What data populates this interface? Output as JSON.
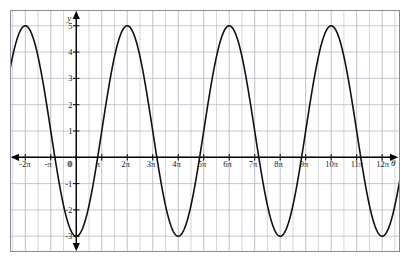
{
  "chart_data": {
    "type": "line",
    "title": "",
    "subtitle": "",
    "xlabel": "θ",
    "ylabel": "y",
    "xlim": [
      -2.6,
      12.7
    ],
    "ylim": [
      -3.6,
      5.6
    ],
    "xlim_units": "multiples of pi",
    "grid": true,
    "grid_step_x_pi": 0.5,
    "grid_step_y": 1,
    "legend": "none",
    "function": "y = 1 - 4 cos(x/2), x in radians (x axis in multiples of pi)",
    "amplitude": 4,
    "midline": 1,
    "period_pi": 4,
    "maximum": 5,
    "minimum": -3,
    "x_tick_labels": [
      "-2π",
      "-π",
      "0",
      "π",
      "2π",
      "3π",
      "4π",
      "5π",
      "6π",
      "7π",
      "8π",
      "9π",
      "10π",
      "11π",
      "12π"
    ],
    "x_tick_values_pi": [
      -2,
      -1,
      0,
      1,
      2,
      3,
      4,
      5,
      6,
      7,
      8,
      9,
      10,
      11,
      12
    ],
    "y_tick_labels": [
      "5",
      "4",
      "3",
      "2",
      "1",
      "0",
      "-1",
      "-2",
      "-3"
    ],
    "y_tick_values": [
      5,
      4,
      3,
      2,
      1,
      0,
      -1,
      -2,
      -3
    ],
    "peaks_x_pi": [
      -1,
      3,
      7,
      11
    ],
    "peaks_y": [
      5,
      5,
      5,
      5
    ],
    "troughs_x_pi": [
      1,
      5,
      9
    ],
    "troughs_y": [
      -3,
      -3,
      -3
    ],
    "series": [
      {
        "name": "y = 1 - 4 cos(x/2)",
        "color": "#111111",
        "x_pi": [
          -2.6,
          -2.5,
          -2.4,
          -2.3,
          -2.2,
          -2.1,
          -2.0,
          -1.9,
          -1.8,
          -1.7,
          -1.6,
          -1.5,
          -1.4,
          -1.3,
          -1.2,
          -1.1,
          -1.0,
          -0.9,
          -0.8,
          -0.7,
          -0.6,
          -0.5,
          -0.4,
          -0.3,
          -0.2,
          -0.1,
          0.0,
          0.1,
          0.2,
          0.3,
          0.4,
          0.5,
          0.6,
          0.7,
          0.8,
          0.9,
          1.0,
          1.1,
          1.2,
          1.3,
          1.4,
          1.5,
          1.6,
          1.7,
          1.8,
          1.9,
          2.0,
          2.1,
          2.2,
          2.3,
          2.4,
          2.5,
          2.6,
          2.7,
          2.8,
          2.9,
          3.0,
          3.1,
          3.2,
          3.3,
          3.4,
          3.5,
          3.6,
          3.7,
          3.8,
          3.9,
          4.0,
          4.1,
          4.2,
          4.3,
          4.4,
          4.5,
          4.6,
          4.7,
          4.8,
          4.9,
          5.0,
          5.1,
          5.2,
          5.3,
          5.4,
          5.5,
          5.6,
          5.7,
          5.8,
          5.9,
          6.0,
          6.1,
          6.2,
          6.3,
          6.4,
          6.5,
          6.6,
          6.7,
          6.8,
          6.9,
          7.0,
          7.1,
          7.2,
          7.3,
          7.4,
          7.5,
          7.6,
          7.7,
          7.8,
          7.9,
          8.0,
          8.1,
          8.2,
          8.3,
          8.4,
          8.5,
          8.6,
          8.7,
          8.8,
          8.9,
          9.0,
          9.1,
          9.2,
          9.3,
          9.4,
          9.5,
          9.6,
          9.7,
          9.8,
          9.9,
          10.0,
          10.1,
          10.2,
          10.3,
          10.4,
          10.5,
          10.6,
          10.7,
          10.8,
          10.9,
          11.0,
          11.1,
          11.2,
          11.3,
          11.4,
          11.5,
          11.6,
          11.7,
          11.8,
          11.9,
          12.0,
          12.1,
          12.2,
          12.3,
          12.4,
          12.5,
          12.6,
          12.7
        ],
        "y": [
          -2.24,
          -1.53,
          -0.74,
          0.1,
          0.98,
          1.88,
          2.76,
          3.62,
          4.41,
          5.0,
          5.0,
          5.0,
          5.0,
          5.0,
          5.0,
          5.0,
          5.0,
          5.0,
          5.0,
          5.0,
          4.41,
          3.62,
          2.76,
          1.88,
          0.98,
          0.1,
          -0.74,
          -1.53,
          -2.24,
          -2.83,
          -3.0,
          -3.0,
          -3.0,
          -3.0,
          -3.0,
          -3.0,
          -3.0,
          -3.0,
          -3.0,
          -3.0,
          -2.83,
          -2.24,
          -1.53,
          -0.74,
          0.1,
          0.98,
          1.88,
          2.76,
          3.62,
          4.41,
          5.0,
          5.0,
          5.0,
          5.0,
          5.0,
          5.0,
          5.0,
          5.0,
          5.0,
          5.0,
          4.41,
          3.62,
          2.76,
          1.88,
          0.98,
          0.1,
          -0.74,
          -1.53,
          -2.24,
          -2.83,
          -3.0,
          -3.0,
          -3.0,
          -3.0,
          -3.0,
          -3.0,
          -3.0,
          -3.0,
          -3.0,
          -3.0,
          -2.83,
          -2.24,
          -1.53,
          -0.74,
          0.1,
          0.98,
          1.88,
          2.76,
          3.62,
          4.41,
          5.0,
          5.0,
          5.0,
          5.0,
          5.0,
          5.0,
          5.0,
          5.0,
          5.0,
          5.0,
          4.41,
          3.62,
          2.76,
          1.88,
          0.98,
          0.1,
          -0.74,
          -1.53,
          -2.24,
          -2.83,
          -3.0,
          -3.0,
          -3.0,
          -3.0,
          -3.0,
          -3.0,
          -3.0,
          -3.0,
          -3.0,
          -3.0,
          -2.83,
          -2.24,
          -1.53,
          -0.74,
          0.1,
          0.98,
          1.88,
          2.76,
          3.62,
          4.41,
          5.0,
          5.0,
          5.0,
          5.0,
          5.0,
          5.0,
          5.0,
          5.0,
          5.0,
          5.0,
          4.41,
          3.62,
          2.76,
          1.88,
          0.98,
          0.1,
          -0.74,
          -1.53,
          -2.24,
          -2.83,
          -3.0,
          -3.0,
          -3.0,
          -3.0
        ]
      }
    ],
    "colors": {
      "curve": "#111111",
      "axis": "#000000",
      "grid": "#b9b9c4",
      "border": "#8a8a97",
      "background": "#ffffff",
      "label": "#1a1a1a"
    }
  }
}
